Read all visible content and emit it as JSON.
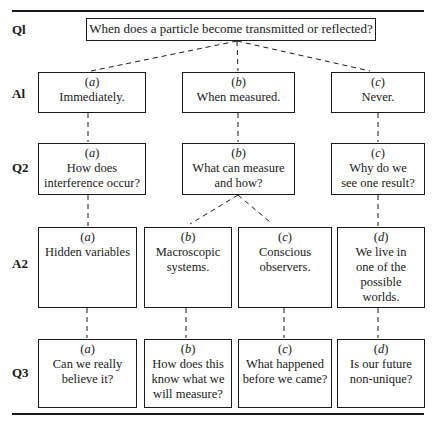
{
  "rows": {
    "q1": "Ql",
    "a1": "Al",
    "q2": "Q2",
    "a2": "A2",
    "q3": "Q3"
  },
  "q1": {
    "text": "When does a particle become transmitted or reflected?"
  },
  "a1": [
    {
      "tag": "a",
      "lines": [
        "Immediately."
      ]
    },
    {
      "tag": "b",
      "lines": [
        "When measured."
      ]
    },
    {
      "tag": "c",
      "lines": [
        "Never."
      ]
    }
  ],
  "q2": [
    {
      "tag": "a",
      "lines": [
        "How does",
        "interference occur?"
      ]
    },
    {
      "tag": "b",
      "lines": [
        "What can measure",
        "and how?"
      ]
    },
    {
      "tag": "c",
      "lines": [
        "Why do we",
        "see one result?"
      ]
    }
  ],
  "a2": [
    {
      "tag": "a",
      "lines": [
        "Hidden variables"
      ]
    },
    {
      "tag": "b",
      "lines": [
        "Macroscopic",
        "systems."
      ]
    },
    {
      "tag": "c",
      "lines": [
        "Conscious",
        "observers."
      ]
    },
    {
      "tag": "d",
      "lines": [
        "We live in",
        "one of the",
        "possible",
        "worlds."
      ]
    }
  ],
  "q3": [
    {
      "tag": "a",
      "lines": [
        "Can we really",
        "believe it?"
      ]
    },
    {
      "tag": "b",
      "lines": [
        "How does this",
        "know what we",
        "will measure?"
      ]
    },
    {
      "tag": "c",
      "lines": [
        "What happened",
        "before we came?"
      ]
    },
    {
      "tag": "d",
      "lines": [
        "Is our future",
        "non-unique?"
      ]
    }
  ],
  "colors": {
    "ink": "#1a1a1a",
    "background": "#ffffff"
  }
}
